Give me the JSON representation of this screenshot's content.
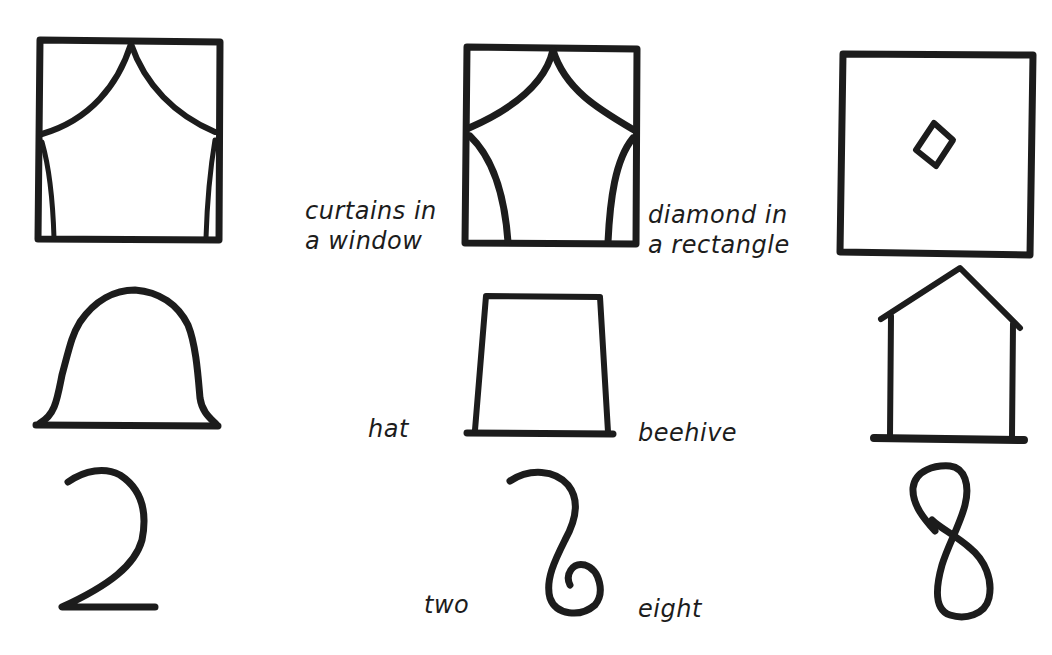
{
  "figure": {
    "theme": "ambiguous figures: the middle drawing in each row can be read as either neighbour",
    "ink_color": "#1c1c1c",
    "background_color": "#ffffff",
    "rows": [
      {
        "name": "row-1",
        "left_figure": "curtains in a window",
        "middle_figure": "ambiguous curtains/diamond window",
        "right_figure": "diamond in a rectangle",
        "labels": {
          "left": "curtains in\na window",
          "right": "diamond in\na rectangle"
        }
      },
      {
        "name": "row-2",
        "left_figure": "hat",
        "middle_figure": "ambiguous hat/beehive shape",
        "right_figure": "house / beehive",
        "labels": {
          "left": "hat",
          "right": "beehive"
        }
      },
      {
        "name": "row-3",
        "left_figure": "numeral 2",
        "middle_figure": "ambiguous 2/8 curl",
        "right_figure": "numeral 8",
        "labels": {
          "left": "two",
          "right": "eight"
        }
      }
    ]
  }
}
